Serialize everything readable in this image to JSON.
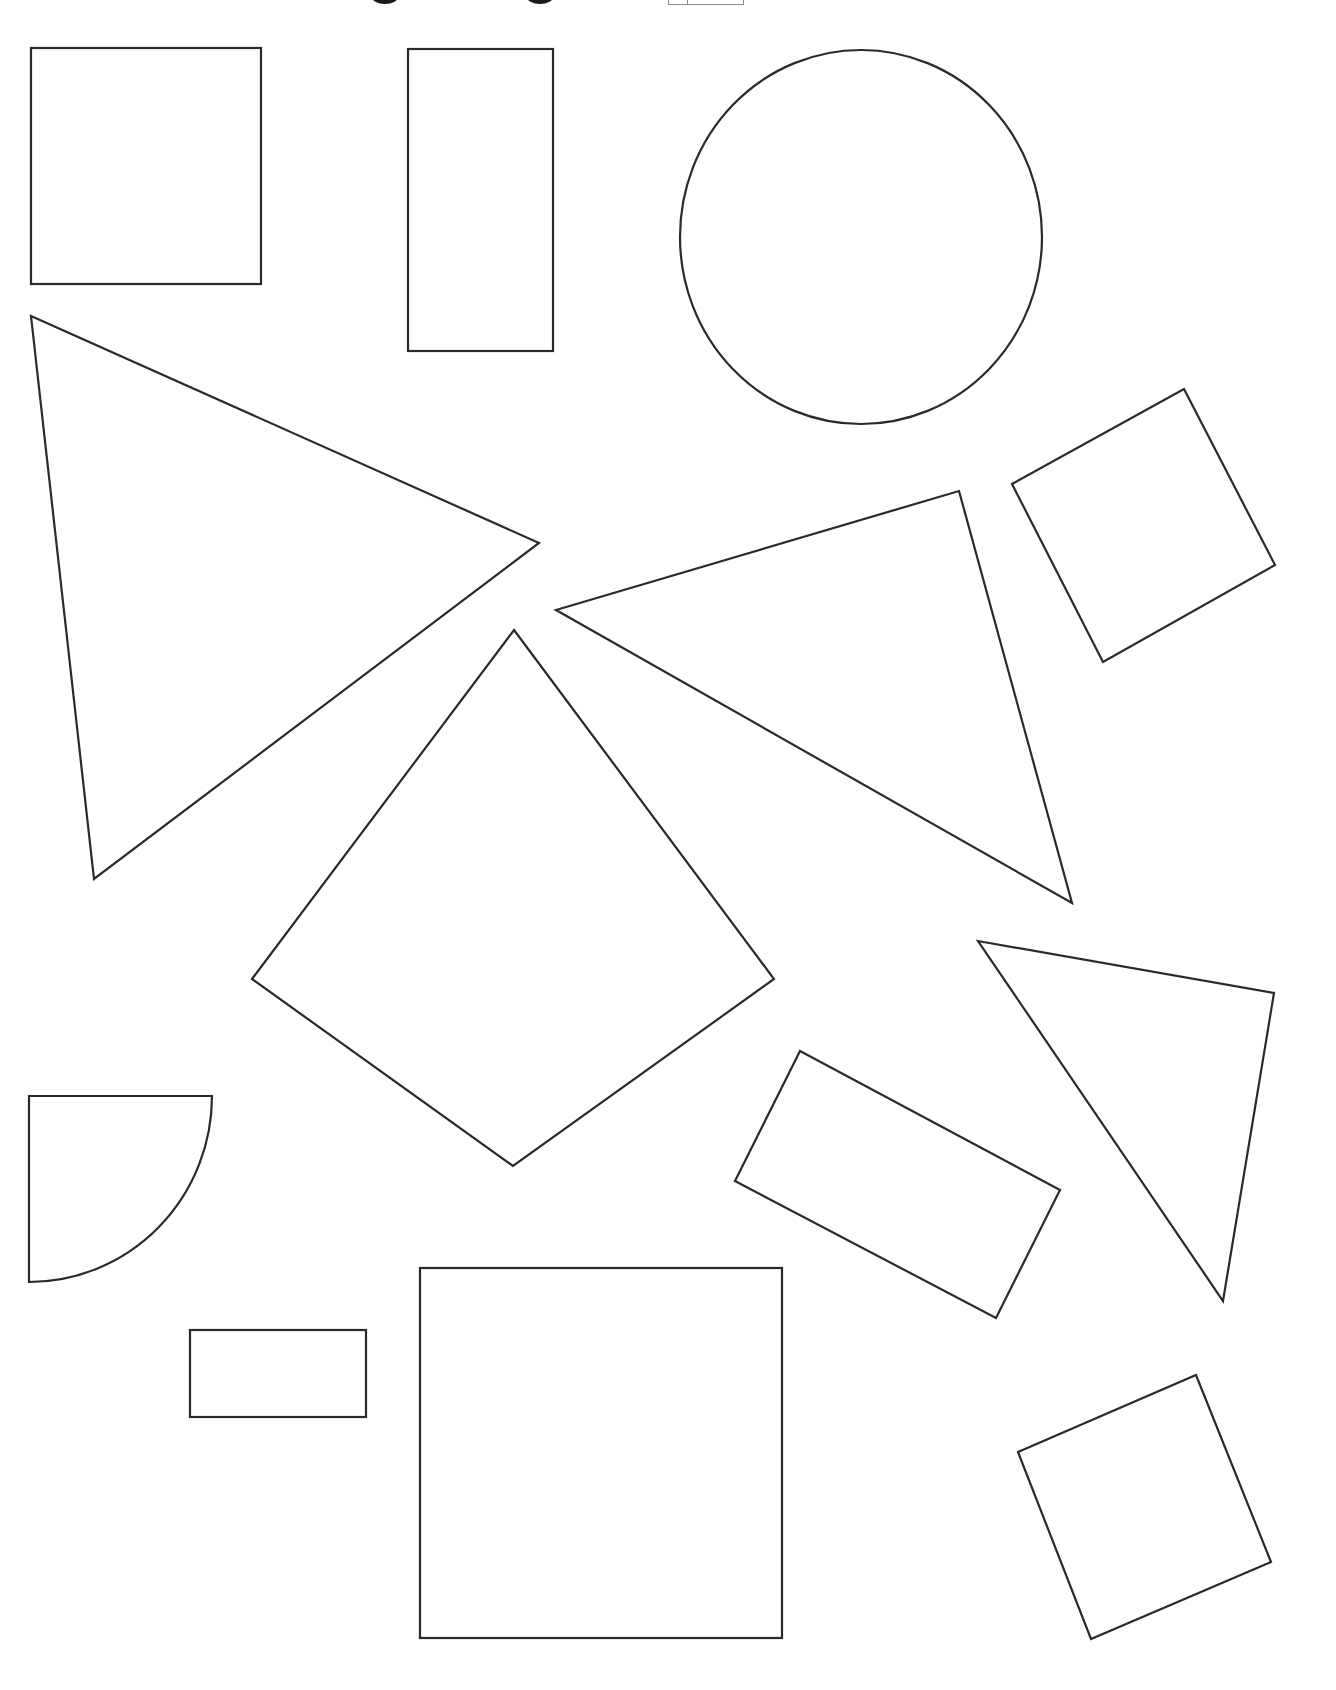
{
  "worksheet": {
    "title_fragment": {
      "visible_text": "",
      "note": "heading cropped at top edge; only descender tails of two glyphs visible",
      "glyph_tails": [
        {
          "x": 385,
          "y": 0
        },
        {
          "x": 540,
          "y": 0
        }
      ],
      "answer_box": {
        "x": 668,
        "width": 74,
        "divider_x": 686
      }
    },
    "stroke_color": "#2a2a2a",
    "background_color": "#ffffff",
    "shapes": [
      {
        "id": "square-top-left",
        "type": "rect",
        "x": 31,
        "y": 48,
        "width": 230,
        "height": 236
      },
      {
        "id": "tall-rectangle",
        "type": "rect",
        "x": 408,
        "y": 49,
        "width": 145,
        "height": 302
      },
      {
        "id": "circle",
        "type": "ellipse",
        "cx": 861,
        "cy": 237,
        "rx": 181,
        "ry": 187
      },
      {
        "id": "tilted-square-right",
        "type": "polygon",
        "points": "1012,484 1184,389 1275,565 1103,662"
      },
      {
        "id": "large-triangle-left",
        "type": "polygon",
        "points": "31,316 539,543 94,879"
      },
      {
        "id": "triangle-middle",
        "type": "polygon",
        "points": "556,610 959,491 1072,903"
      },
      {
        "id": "diamond",
        "type": "polygon",
        "points": "514,630 774,979 513,1166 252,979"
      },
      {
        "id": "triangle-right",
        "type": "polygon",
        "points": "978,941 1274,993 1223,1301"
      },
      {
        "id": "tilted-rectangle",
        "type": "polygon",
        "points": "800,1051 1060,1190 996,1318 735,1181"
      },
      {
        "id": "quarter-circle",
        "type": "path",
        "d": "M29,1096 L212,1096 A183,186 0 0 1 29,1282 Z"
      },
      {
        "id": "small-rectangle",
        "type": "rect",
        "x": 190,
        "y": 1330,
        "width": 176,
        "height": 87
      },
      {
        "id": "large-square-bottom",
        "type": "rect",
        "x": 420,
        "y": 1268,
        "width": 362,
        "height": 370
      },
      {
        "id": "tilted-square-bottom-right",
        "type": "polygon",
        "points": "1018,1452 1196,1375 1271,1562 1091,1639"
      }
    ]
  }
}
